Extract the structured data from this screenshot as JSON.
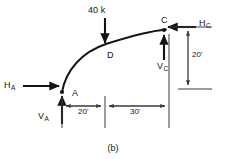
{
  "figure": {
    "caption": "(b)",
    "type": "free-body-diagram"
  },
  "points": {
    "a": {
      "label": "A",
      "x": 62,
      "y": 92
    },
    "c": {
      "label": "C",
      "x": 164,
      "y": 30
    },
    "d": {
      "label": "D",
      "x": 106,
      "y": 46
    }
  },
  "forces": {
    "h_a": {
      "symbol": "H",
      "subscript": "A",
      "direction": "right"
    },
    "v_a": {
      "symbol": "V",
      "subscript": "A",
      "direction": "up"
    },
    "h_c": {
      "symbol": "H",
      "subscript": "C",
      "direction": "left"
    },
    "v_c": {
      "symbol": "V",
      "subscript": "C",
      "direction": "up"
    },
    "applied_load": {
      "value": "40 k",
      "direction": "down",
      "at_point": "D"
    }
  },
  "dimensions": {
    "span_left": "20'",
    "span_right": "30'",
    "rise": "20'"
  },
  "style": {
    "line_color": "#141414",
    "background": "#ffffff",
    "dim_line_color": "#3a3a3a"
  }
}
